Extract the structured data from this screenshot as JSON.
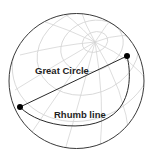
{
  "diagram": {
    "labels": {
      "great_circle": "Great Circle",
      "rhumb_line": "Rhumb line"
    },
    "colors": {
      "globe_outline": "#3a3a3a",
      "graticule": "#d4d4d4",
      "route_line": "#2a2a2a",
      "endpoint": "#000000",
      "text": "#1e1e1e",
      "background": "#ffffff"
    },
    "points": {
      "start": {
        "x": 20,
        "y": 107
      },
      "end": {
        "x": 127,
        "y": 56
      }
    }
  }
}
